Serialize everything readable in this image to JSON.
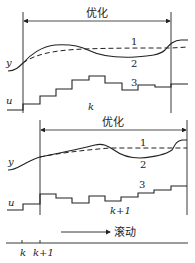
{
  "diagram": {
    "colors": {
      "line": "#222222",
      "background": "#ffffff"
    },
    "top_panel": {
      "horizon_label": "优化",
      "output_label": "y",
      "input_label": "u",
      "time_label": "k",
      "curve_labels": {
        "reference": "1",
        "predicted": "2",
        "control": "3"
      }
    },
    "bottom_panel": {
      "horizon_label": "优化",
      "output_label": "y",
      "input_label": "u",
      "time_label": "k+1",
      "curve_labels": {
        "reference": "1",
        "predicted": "2",
        "control": "3"
      }
    },
    "rolling": {
      "label": "滚动"
    },
    "time_axis": {
      "ticks": [
        "k",
        "k+1"
      ]
    }
  }
}
